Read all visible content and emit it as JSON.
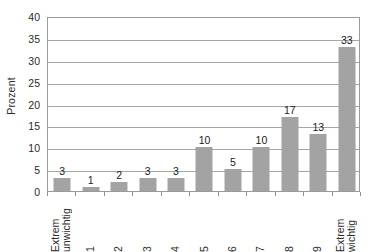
{
  "chart_data": {
    "type": "bar",
    "title": "",
    "xlabel": "",
    "ylabel": "Prozent",
    "categories": [
      "Extrem unwichtig",
      "1",
      "2",
      "3",
      "4",
      "5",
      "6",
      "7",
      "8",
      "9",
      "Extrem wichtig"
    ],
    "category_lines": [
      [
        "Extrem",
        "unwichtig"
      ],
      [
        "1"
      ],
      [
        "2"
      ],
      [
        "3"
      ],
      [
        "4"
      ],
      [
        "5"
      ],
      [
        "6"
      ],
      [
        "7"
      ],
      [
        "8"
      ],
      [
        "9"
      ],
      [
        "Extrem",
        "wichtig"
      ]
    ],
    "values": [
      3,
      1,
      2,
      3,
      3,
      10,
      5,
      10,
      17,
      13,
      33
    ],
    "data_labels": [
      "3",
      "1",
      "2",
      "3",
      "3",
      "10",
      "5",
      "10",
      "17",
      "13",
      "33"
    ],
    "ylim": [
      0,
      40
    ],
    "ytick_values": [
      0,
      5,
      10,
      15,
      20,
      25,
      30,
      35,
      40
    ],
    "ytick_labels": [
      "0",
      "5",
      "10",
      "15",
      "20",
      "25",
      "30",
      "35",
      "40"
    ],
    "grid": true,
    "grid_axis": "y",
    "legend": false,
    "legend_position": "none",
    "series_name": "Prozent",
    "colors": {
      "bar": "#a3a3a3",
      "gridline": "#a6a6a6",
      "axis": "#9a9a9a",
      "text": "#1a1a1a",
      "background": "#ffffff"
    }
  }
}
